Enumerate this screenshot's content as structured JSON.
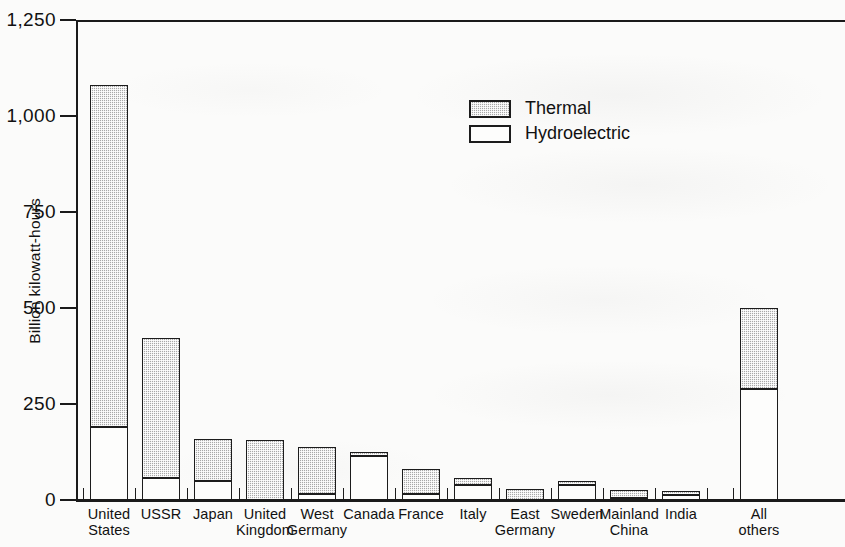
{
  "chart_data": {
    "type": "bar",
    "stacked": true,
    "title": "",
    "xlabel": "",
    "ylabel": "Billion kilowatt-hours",
    "ylim": [
      0,
      1250
    ],
    "yticks": [
      0,
      250,
      500,
      750,
      1000,
      1250
    ],
    "ytick_labels": [
      "0",
      "250",
      "500",
      "750",
      "1,000",
      "1,250"
    ],
    "grid": false,
    "legend_position": "upper-center",
    "categories": [
      "United States",
      "USSR",
      "Japan",
      "United Kingdom",
      "West Germany",
      "Canada",
      "France",
      "Italy",
      "East Germany",
      "Sweden",
      "Mainland China",
      "India",
      "All others"
    ],
    "series": [
      {
        "name": "Hydroelectric",
        "color": "#fdfdfc",
        "values": [
          190,
          58,
          50,
          0,
          15,
          115,
          15,
          38,
          0,
          40,
          5,
          12,
          290
        ]
      },
      {
        "name": "Thermal",
        "color": "#a8a8a8",
        "values": [
          890,
          364,
          110,
          155,
          123,
          10,
          65,
          20,
          28,
          8,
          22,
          8,
          210
        ]
      }
    ],
    "totals": [
      1080,
      422,
      160,
      155,
      138,
      125,
      80,
      58,
      28,
      48,
      27,
      20,
      500
    ]
  },
  "legend": {
    "items": [
      {
        "label": "Thermal",
        "swatch": "thermal"
      },
      {
        "label": "Hydroelectric",
        "swatch": "hydro"
      }
    ]
  },
  "axis": {
    "y_title": "Billion kilowatt-hours",
    "y_tick_labels": [
      "1,250",
      "1,000",
      "750",
      "500",
      "250",
      "0"
    ]
  },
  "x_tick_labels": [
    "United\nStates",
    "USSR",
    "Japan",
    "United\nKingdom",
    "West\nGermany",
    "Canada",
    "France",
    "Italy",
    "East\nGermany",
    "Sweden",
    "Mainland\nChina",
    "India",
    "All\nothers"
  ]
}
